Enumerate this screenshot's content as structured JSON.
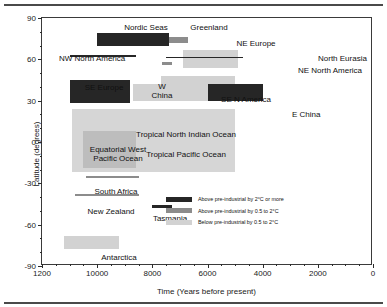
{
  "chart_data": {
    "type": "bar",
    "title": "",
    "xlabel": "Time (Years before present)",
    "ylabel": "Latitude (degrees)",
    "xlim": [
      12000,
      0
    ],
    "ylim": [
      -90,
      90
    ],
    "xticks": [
      12000,
      10000,
      8000,
      6000,
      4000,
      2000,
      0
    ],
    "xtick_labels": [
      "1200",
      "10000",
      "8000",
      "6000",
      "4000",
      "2000",
      "0"
    ],
    "yticks": [
      90,
      60,
      30,
      0,
      -30,
      -60,
      -90
    ],
    "ytick_labels": [
      "90",
      "60",
      "30",
      "0",
      "-30",
      "-60",
      "-90"
    ],
    "x_minor_step": 500,
    "y_minor_step": 10,
    "grid": false,
    "x_axis_reversed": true,
    "legend_position": "inside lower right",
    "series": [
      {
        "name": "Above pre-industrial by 2°C or more",
        "color": "#262626",
        "items": [
          {
            "label": "Nordic Seas",
            "x_start": 10000,
            "x_end": 7400,
            "lat_low": 70,
            "lat_high": 79
          },
          {
            "label": "NW North America",
            "x_start": 11000,
            "x_end": 8600,
            "lat_low": 62,
            "lat_high": 63
          },
          {
            "label": "North Eurasia",
            "x_start": 7500,
            "x_end": 4700,
            "lat_low": 61,
            "lat_high": 62
          },
          {
            "label": "SE Europe",
            "x_start": 11000,
            "x_end": 8800,
            "lat_low": 28,
            "lat_high": 45
          },
          {
            "label": "E China",
            "x_start": 6000,
            "x_end": 4000,
            "lat_low": 30,
            "lat_high": 42
          },
          {
            "label": "Tasmania",
            "x_start": 8000,
            "x_end": 7300,
            "lat_low": -46,
            "lat_high": -46
          }
        ]
      },
      {
        "name": "Above pre-industrial by 0.5 to 2°C",
        "color": "#8c8c8c",
        "items": [
          {
            "label": "Greenland",
            "x_start": 7550,
            "x_end": 6700,
            "lat_low": 72,
            "lat_high": 76
          },
          {
            "label": "NE North America",
            "x_start": 7650,
            "x_end": 7300,
            "lat_low": 57,
            "lat_high": 58
          },
          {
            "label": "South Africa",
            "x_start": 10400,
            "x_end": 8500,
            "lat_low": -25,
            "lat_high": -25
          },
          {
            "label": "New Zealand",
            "x_start": 10800,
            "x_end": 8500,
            "lat_low": -38,
            "lat_high": -38
          }
        ]
      },
      {
        "name": "Below pre-industrial by 0.5 to 2°C",
        "color": "#d2d2d2",
        "items": [
          {
            "label": "NE Europe",
            "x_start": 6900,
            "x_end": 4900,
            "lat_low": 54,
            "lat_high": 67
          },
          {
            "label": "W China",
            "x_start": 8700,
            "x_end": 6000,
            "lat_low": 30,
            "lat_high": 42
          },
          {
            "label": "SE N America",
            "x_start": 7700,
            "x_end": 5000,
            "lat_low": 30,
            "lat_high": 48
          },
          {
            "label": "Tropical North Indian Ocean / Tropical Pacific Ocean",
            "x_start": 10900,
            "x_end": 5000,
            "lat_low": -22,
            "lat_high": 24
          },
          {
            "label": "Equatorial West Pacific Ocean",
            "x_start": 10500,
            "x_end": 8600,
            "lat_low": -19,
            "lat_high": 8
          },
          {
            "label": "Antarctica",
            "x_start": 11200,
            "x_end": 9200,
            "lat_low": -78,
            "lat_high": -68
          }
        ]
      }
    ],
    "annotations": [
      "Nordic Seas",
      "Greenland",
      "NE Europe",
      "NW North America",
      "North Eurasia",
      "NE North America",
      "SE Europe",
      "W China",
      "SE N America",
      "E China",
      "Equatorial West Pacific Ocean",
      "Tropical North Indian Ocean",
      "Tropical Pacific Ocean",
      "South Africa",
      "New Zealand",
      "Tasmania",
      "Antarctica"
    ]
  },
  "axes": {
    "y_title": "Latitude (degrees)",
    "x_title": "Time (Years before present)"
  },
  "labels": {
    "nordic_seas": "Nordic Seas",
    "greenland": "Greenland",
    "ne_europe": "NE Europe",
    "nw_north_america": "NW North America",
    "north_eurasia": "North Eurasia",
    "ne_north_america": "NE North America",
    "se_europe": "SE Europe",
    "w_china_l1": "W",
    "w_china_l2": "China",
    "se_n_america": "SE N America",
    "e_china": "E China",
    "eq_west_pacific_l1": "Equatorial West",
    "eq_west_pacific_l2": "Pacific Ocean",
    "trop_n_indian": "Tropical North Indian Ocean",
    "trop_pacific": "Tropical Pacific Ocean",
    "south_africa": "South Africa",
    "new_zealand": "New Zealand",
    "tasmania": "Tasmania",
    "antarctica": "Antarctica"
  },
  "legend": {
    "rows": [
      {
        "text": "Above pre-industrial by 2°C or more",
        "color": "#262626"
      },
      {
        "text": "Above pre-industrial by 0.5 to 2°C",
        "color": "#8c8c8c"
      },
      {
        "text": "Below pre-industrial by 0.5 to 2°C",
        "color": "#d2d2d2"
      }
    ]
  }
}
